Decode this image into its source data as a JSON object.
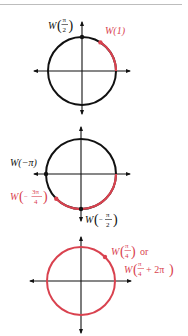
{
  "colors": {
    "axis": "#111111",
    "circle": "#111111",
    "highlight": "#d9424f"
  },
  "figures": [
    {
      "id": "fig1",
      "center": [
        82,
        71
      ],
      "radius": 34,
      "arc": {
        "from": 0,
        "to": 1,
        "color": "highlight"
      },
      "points": [
        {
          "angle": "pi/2",
          "color": "axis",
          "label": {
            "fn": "W",
            "num": "π",
            "den": "2"
          }
        },
        {
          "angle": "1",
          "color": "highlight",
          "label": {
            "text": "W(1)"
          }
        }
      ]
    },
    {
      "id": "fig2",
      "center": [
        81,
        174
      ],
      "radius": 35,
      "arc": {
        "from": "-3pi/4",
        "to": 0,
        "color": "highlight"
      },
      "points": [
        {
          "angle": "-pi",
          "color": "axis",
          "label": {
            "text": "W(−π)"
          }
        },
        {
          "angle": "-3pi/4",
          "color": "highlight",
          "label": {
            "fn": "W",
            "sign": "−",
            "num": "3π",
            "den": "4"
          }
        },
        {
          "angle": "-pi/2",
          "color": "axis",
          "label": {
            "fn": "W",
            "sign": "−",
            "num": "π",
            "den": "2"
          }
        }
      ]
    },
    {
      "id": "fig3",
      "center": [
        81,
        281
      ],
      "radius": 34,
      "full_circle_color": "highlight",
      "points": [
        {
          "angle": "pi/4",
          "color": "highlight",
          "label": {
            "line1": {
              "fn": "W",
              "num": "π",
              "den": "4",
              "suffix": "or"
            },
            "line2": {
              "fn": "W",
              "num": "π",
              "den": "4",
              "tail": "+ 2π"
            }
          }
        }
      ]
    }
  ],
  "labels": {
    "w": "W",
    "pi": "π",
    "two": "2",
    "three_pi": "3π",
    "four": "4",
    "minus": "−",
    "or": "or",
    "plus_two_pi": "+ 2π",
    "w_of_1": "W(1)",
    "w_of_neg_pi": "W(−π)",
    "lparen": "(",
    "rparen": ")"
  }
}
